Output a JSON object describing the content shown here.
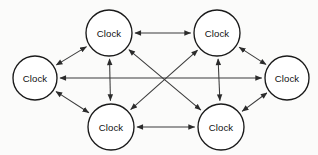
{
  "diagram": {
    "type": "node-link-graph",
    "background_color": "#fbfbfa",
    "node_fill_color": "#ffffff",
    "node_stroke_color": "#1a1a1a",
    "edge_color": "#3a3a3a",
    "label_color": "#111111",
    "node_radius": 23,
    "edge_style": "bidirectional-arrow",
    "nodes": [
      {
        "id": "top-left",
        "label": "Clock",
        "cx": 109,
        "cy": 33,
        "r": 23
      },
      {
        "id": "top-right",
        "label": "Clock",
        "cx": 217,
        "cy": 33,
        "r": 23
      },
      {
        "id": "left",
        "label": "Clock",
        "cx": 35,
        "cy": 78,
        "r": 22
      },
      {
        "id": "right",
        "label": "Clock",
        "cx": 287,
        "cy": 78,
        "r": 22
      },
      {
        "id": "bottom-left",
        "label": "Clock",
        "cx": 111,
        "cy": 127,
        "r": 23
      },
      {
        "id": "bottom-right",
        "label": "Clock",
        "cx": 221,
        "cy": 127,
        "r": 23
      }
    ],
    "edges": [
      {
        "id": "edge-tl-tr",
        "from": "top-left",
        "to": "top-right",
        "arrows": "both"
      },
      {
        "id": "edge-bl-br",
        "from": "bottom-left",
        "to": "bottom-right",
        "arrows": "both"
      },
      {
        "id": "edge-tl-bl",
        "from": "top-left",
        "to": "bottom-left",
        "arrows": "both"
      },
      {
        "id": "edge-tr-br",
        "from": "top-right",
        "to": "bottom-right",
        "arrows": "both"
      },
      {
        "id": "edge-l-r",
        "from": "left",
        "to": "right",
        "arrows": "both"
      },
      {
        "id": "edge-l-tl",
        "from": "left",
        "to": "top-left",
        "arrows": "both"
      },
      {
        "id": "edge-l-bl",
        "from": "left",
        "to": "bottom-left",
        "arrows": "both"
      },
      {
        "id": "edge-r-tr",
        "from": "right",
        "to": "top-right",
        "arrows": "both"
      },
      {
        "id": "edge-r-br",
        "from": "right",
        "to": "bottom-right",
        "arrows": "both"
      },
      {
        "id": "edge-tl-br",
        "from": "top-left",
        "to": "bottom-right",
        "arrows": "both"
      },
      {
        "id": "edge-tr-bl",
        "from": "top-right",
        "to": "bottom-left",
        "arrows": "both"
      }
    ]
  }
}
